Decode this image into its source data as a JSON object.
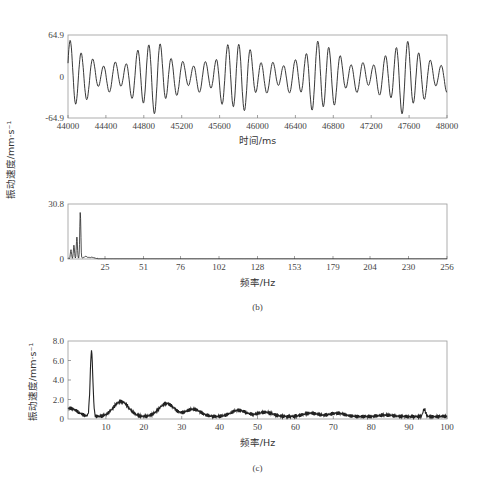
{
  "chart_data": [
    {
      "id": "a",
      "type": "line",
      "title": "",
      "xlabel": "时间/ms",
      "ylabel": "振动速度/mm·s⁻¹",
      "xlim": [
        44000,
        48000
      ],
      "ylim": [
        -64.9,
        64.9
      ],
      "x_ticks": [
        "44000",
        "44400",
        "44800",
        "45200",
        "45600",
        "46000",
        "46400",
        "46800",
        "47200",
        "47600",
        "48000"
      ],
      "y_ticks": [
        "64.9",
        "0",
        "-64.9"
      ],
      "grid": false,
      "description": "Quasi-periodic vibration velocity waveform with ~8.3 Hz carrier and beat modulation; peaks about ±50 mm/s",
      "series": [
        {
          "name": "velocity",
          "carrier_hz": 8.4,
          "amplitude_range": [
            20,
            52
          ]
        }
      ]
    },
    {
      "id": "b",
      "type": "line",
      "title": "",
      "caption": "(b)",
      "xlabel": "频率/Hz",
      "ylabel": "振动速度/mm·s⁻¹",
      "xlim": [
        0,
        256
      ],
      "ylim": [
        0,
        30.8
      ],
      "x_ticks": [
        "25",
        "51",
        "76",
        "102",
        "128",
        "153",
        "179",
        "204",
        "230",
        "256"
      ],
      "y_ticks": [
        "30.8",
        "0"
      ],
      "grid": false,
      "series": [
        {
          "name": "spectrum",
          "peaks": [
            {
              "x": 2,
              "y": 5
            },
            {
              "x": 4,
              "y": 7.5
            },
            {
              "x": 6,
              "y": 12
            },
            {
              "x": 8.3,
              "y": 26
            },
            {
              "x": 12,
              "y": 1
            },
            {
              "x": 16,
              "y": 0.6
            }
          ]
        }
      ]
    },
    {
      "id": "c",
      "type": "line",
      "title": "",
      "caption": "(c)",
      "xlabel": "频率/Hz",
      "ylabel": "振动速度/mm·s⁻¹",
      "xlim": [
        0,
        100
      ],
      "ylim": [
        0,
        8.0
      ],
      "x_ticks": [
        "10",
        "20",
        "30",
        "40",
        "50",
        "60",
        "70",
        "80",
        "90",
        "100"
      ],
      "y_ticks": [
        "8.0",
        "6.0",
        "4.0",
        "2.0",
        "0"
      ],
      "grid": false,
      "series": [
        {
          "name": "spectrum",
          "peaks": [
            {
              "x": 0.5,
              "y": 1.1
            },
            {
              "x": 6.2,
              "y": 6.9
            },
            {
              "x": 14,
              "y": 1.8
            },
            {
              "x": 26,
              "y": 1.6
            },
            {
              "x": 33,
              "y": 1.0
            },
            {
              "x": 45,
              "y": 0.9
            },
            {
              "x": 52,
              "y": 0.7
            },
            {
              "x": 64,
              "y": 0.6
            },
            {
              "x": 71,
              "y": 0.6
            },
            {
              "x": 84,
              "y": 0.4
            },
            {
              "x": 94,
              "y": 1.0
            },
            {
              "x": 99,
              "y": 0.3
            }
          ]
        }
      ]
    }
  ],
  "labels": {
    "ylabel_top": "振动速度/mm·s⁻¹",
    "ylabel_c": "振动速度/mm·s⁻¹",
    "xlabel_a": "时间/ms",
    "xlabel_b": "频率/Hz",
    "xlabel_c": "频率/Hz",
    "caption_b": "(b)",
    "caption_c": "(c)"
  }
}
